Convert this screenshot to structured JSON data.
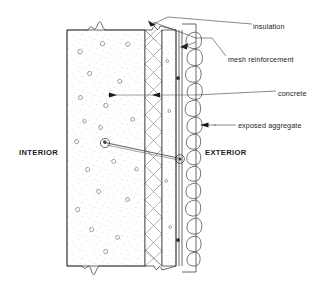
{
  "drawing": {
    "title_visible": false,
    "type": "architectural-wall-section-detail",
    "labels": {
      "insulation": "insulation",
      "mesh_reinforcement": "mesh reinforcement",
      "concrete": "concrete",
      "exposed_aggregate": "exposed aggregate",
      "interior": "INTERIOR",
      "exterior": "EXTERIOR"
    },
    "colors": {
      "background": "#ffffff",
      "line": "#2a2a2a",
      "hatch": "#6a6a6a",
      "aggregate": "#4a4a4a",
      "text": "#1c1c1c",
      "stipple": "#9a9a9a"
    },
    "layers": [
      {
        "name": "concrete-inner-wythe",
        "x_start": 67,
        "x_end": 145,
        "hatch": "stipple"
      },
      {
        "name": "insulation-layer",
        "x_start": 145,
        "x_end": 162,
        "hatch": "cross-hatch"
      },
      {
        "name": "concrete-outer-wythe",
        "x_start": 162,
        "x_end": 176,
        "hatch": "stipple"
      },
      {
        "name": "mesh-reinforcement-line",
        "x_start": 176,
        "x_end": 182,
        "hatch": "none"
      },
      {
        "name": "exposed-aggregate-face",
        "x_start": 182,
        "x_end": 200,
        "hatch": "lobes"
      }
    ],
    "callouts": [
      {
        "name": "insulation",
        "anchor_x": 157,
        "anchor_y": 22,
        "text_x": 253,
        "text_y": 26
      },
      {
        "name": "mesh-reinforcement",
        "anchor_x": 180,
        "anchor_y": 48,
        "text_x": 228,
        "text_y": 59
      },
      {
        "name": "concrete",
        "anchor_x": 180,
        "anchor_y": 95,
        "text_x": 278,
        "text_y": 93
      },
      {
        "name": "exposed-aggregate",
        "anchor_x": 196,
        "anchor_y": 125,
        "text_x": 238,
        "text_y": 125
      }
    ],
    "aggregate_lobe_count": 12,
    "mesh_marker_count": 2,
    "tie_anchor": {
      "inner_x": 105,
      "inner_y": 142,
      "outer_x": 180,
      "outer_y": 158
    }
  }
}
